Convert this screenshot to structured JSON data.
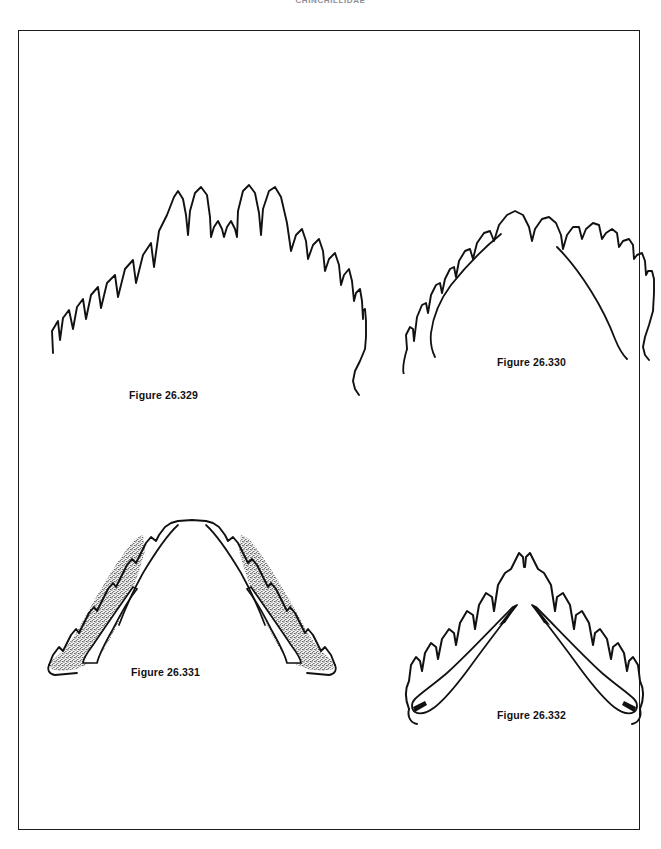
{
  "page": {
    "header_text": "CHINCHILLIDAE",
    "background_color": "#ffffff",
    "ink_color": "#111111",
    "border_color": "#1b1b1b"
  },
  "figures": [
    {
      "id": "26.329",
      "caption": "Figure 26.329",
      "subject": "dental arch, occlusal view",
      "shape": "broad rounded arch",
      "features": "outline only, no stippling, four prominent anterior cusps"
    },
    {
      "id": "26.330",
      "caption": "Figure 26.330",
      "subject": "dental arch, occlusal view",
      "shape": "wide shallow arch",
      "features": "outline with inner ramus border lines, serrated tooth row"
    },
    {
      "id": "26.331",
      "caption": "Figure 26.331",
      "subject": "dental arch, occlusal view",
      "shape": "narrow V-shaped arch",
      "features": "stippled shading on both rami, open inner channel"
    },
    {
      "id": "26.332",
      "caption": "Figure 26.332",
      "subject": "dental arch, occlusal view",
      "shape": "sharp V-shaped arch",
      "features": "outline with tapering inner lines, deeply serrated tooth row"
    }
  ]
}
